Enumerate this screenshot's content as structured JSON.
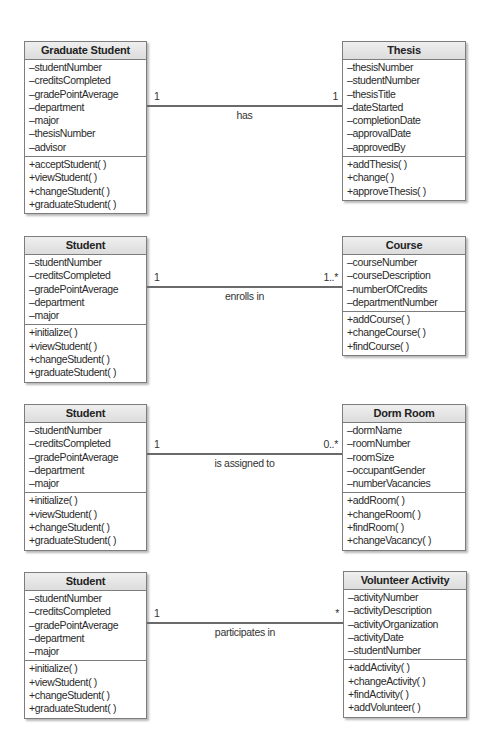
{
  "diagram": {
    "rows": [
      {
        "left": {
          "name": "Graduate Student",
          "attributes": [
            "–studentNumber",
            "–creditsCompleted",
            "–gradePointAverage",
            "–department",
            "–major",
            "–thesisNumber",
            "–advisor"
          ],
          "methods": [
            "+acceptStudent( )",
            "+viewStudent( )",
            "+changeStudent( )",
            "+graduateStudent( )"
          ]
        },
        "right": {
          "name": "Thesis",
          "attributes": [
            "–thesisNumber",
            "–studentNumber",
            "–thesisTitle",
            "–dateStarted",
            "–completionDate",
            "–approvalDate",
            "–approvedBy"
          ],
          "methods": [
            "+addThesis( )",
            "+change( )",
            "+approveThesis( )"
          ]
        },
        "association": {
          "label": "has",
          "left_multiplicity": "1",
          "right_multiplicity": "1"
        }
      },
      {
        "left": {
          "name": "Student",
          "attributes": [
            "–studentNumber",
            "–creditsCompleted",
            "–gradePointAverage",
            "–department",
            "–major"
          ],
          "methods": [
            "+initialize( )",
            "+viewStudent( )",
            "+changeStudent( )",
            "+graduateStudent( )"
          ]
        },
        "right": {
          "name": "Course",
          "attributes": [
            "–courseNumber",
            "–courseDescription",
            "–numberOfCredits",
            "–departmentNumber"
          ],
          "methods": [
            "+addCourse( )",
            "+changeCourse( )",
            "+findCourse( )"
          ]
        },
        "association": {
          "label": "enrolls in",
          "left_multiplicity": "1",
          "right_multiplicity": "1..*"
        }
      },
      {
        "left": {
          "name": "Student",
          "attributes": [
            "–studentNumber",
            "–creditsCompleted",
            "–gradePointAverage",
            "–department",
            "–major"
          ],
          "methods": [
            "+initialize( )",
            "+viewStudent( )",
            "+changeStudent( )",
            "+graduateStudent( )"
          ]
        },
        "right": {
          "name": "Dorm Room",
          "attributes": [
            "–dormName",
            "–roomNumber",
            "–roomSize",
            "–occupantGender",
            "–numberVacancies"
          ],
          "methods": [
            "+addRoom( )",
            "+changeRoom( )",
            "+findRoom( )",
            "+changeVacancy( )"
          ]
        },
        "association": {
          "label": "is assigned to",
          "left_multiplicity": "1",
          "right_multiplicity": "0..*"
        }
      },
      {
        "left": {
          "name": "Student",
          "attributes": [
            "–studentNumber",
            "–creditsCompleted",
            "–gradePointAverage",
            "–department",
            "–major"
          ],
          "methods": [
            "+initialize( )",
            "+viewStudent( )",
            "+changeStudent( )",
            "+graduateStudent( )"
          ]
        },
        "right": {
          "name": "Volunteer Activity",
          "attributes": [
            "–activityNumber",
            "–activityDescription",
            "–activityOrganization",
            "–activityDate",
            "–studentNumber"
          ],
          "methods": [
            "+addActivity( )",
            "+changeActivity( )",
            "+findActivity( )",
            "+addVolunteer( )"
          ]
        },
        "association": {
          "label": "participates in",
          "left_multiplicity": "1",
          "right_multiplicity": "*"
        }
      }
    ]
  }
}
